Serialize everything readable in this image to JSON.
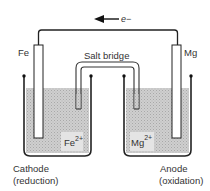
{
  "electron_flow": {
    "label": "e−",
    "direction": "left"
  },
  "salt_bridge": {
    "label": "Salt bridge"
  },
  "electrodes": [
    {
      "side": "left",
      "metal": "Fe",
      "role": "Cathode",
      "process": "(reduction)",
      "ion": "Fe",
      "ion_charge": "2+"
    },
    {
      "side": "right",
      "metal": "Mg",
      "role": "Anode",
      "process": "(oxidation)",
      "ion": "Mg",
      "ion_charge": "2+"
    }
  ],
  "colors": {
    "solution": "#c8c8c8",
    "line": "#222222",
    "background": "#ffffff"
  }
}
